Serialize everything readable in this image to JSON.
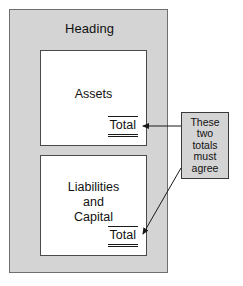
{
  "diagram": {
    "statement": {
      "heading": "Heading",
      "sections": [
        {
          "name": "assets",
          "title": "Assets",
          "total_label": "Total"
        },
        {
          "name": "liabilities-and-capital",
          "title": "Liabilities\nand\nCapital",
          "total_label": "Total"
        }
      ]
    },
    "callout": {
      "text": "These\ntwo\ntotals\nmust\nagree"
    },
    "colors": {
      "panel_fill": "#d4d4d4",
      "panel_stroke": "#6e6e6e",
      "section_fill": "#ffffff",
      "section_stroke": "#4a4a4a",
      "text": "#111111",
      "arrow": "#1a1a1a"
    }
  }
}
